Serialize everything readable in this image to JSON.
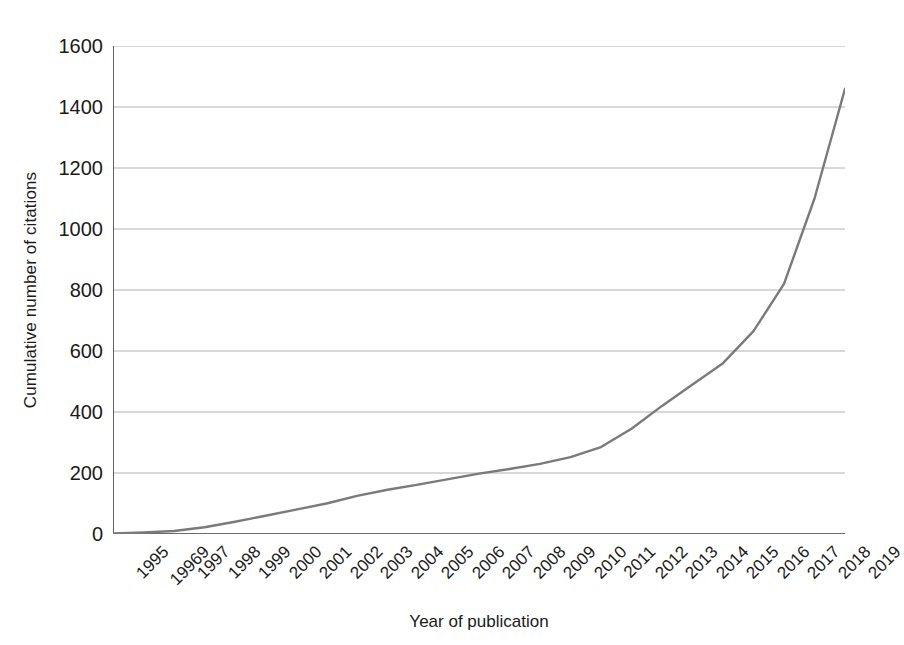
{
  "chart_data": {
    "type": "line",
    "title": "",
    "xlabel": "Year of publication",
    "ylabel": "Cumulative number of citations",
    "x": [
      "1995",
      "19969",
      "1997",
      "1998",
      "1999",
      "2000",
      "2001",
      "2002",
      "2003",
      "2004",
      "2005",
      "2006",
      "2007",
      "2008",
      "2009",
      "2010",
      "2011",
      "2012",
      "2013",
      "2014",
      "2015",
      "2016",
      "2017",
      "2018",
      "2019"
    ],
    "x_values": [
      1995,
      1996,
      1997,
      1998,
      1999,
      2000,
      2001,
      2002,
      2003,
      2004,
      2005,
      2006,
      2007,
      2008,
      2009,
      2010,
      2011,
      2012,
      2013,
      2014,
      2015,
      2016,
      2017,
      2018,
      2019
    ],
    "values": [
      2,
      5,
      10,
      22,
      40,
      60,
      80,
      100,
      125,
      145,
      162,
      180,
      198,
      213,
      230,
      252,
      285,
      345,
      420,
      490,
      560,
      665,
      820,
      1100,
      1460
    ],
    "series": [
      {
        "name": "Cumulative citations",
        "color": "#7a7a7a",
        "values": [
          2,
          5,
          10,
          22,
          40,
          60,
          80,
          100,
          125,
          145,
          162,
          180,
          198,
          213,
          230,
          252,
          285,
          345,
          420,
          490,
          560,
          665,
          820,
          1100,
          1460
        ]
      }
    ],
    "yticks": [
      0,
      200,
      400,
      600,
      800,
      1000,
      1200,
      1400,
      1600
    ],
    "ytick_labels": [
      "0",
      "200",
      "400",
      "600",
      "800",
      "1000",
      "1200",
      "1400",
      "1600"
    ],
    "ylim": [
      0,
      1600
    ],
    "xlim": [
      1995,
      2019
    ],
    "grid": "horizontal",
    "legend": "none",
    "line_color": "#7a7a7a",
    "grid_color": "#b0b0b0",
    "axis_color": "#3a3a3a",
    "background": "#ffffff"
  }
}
